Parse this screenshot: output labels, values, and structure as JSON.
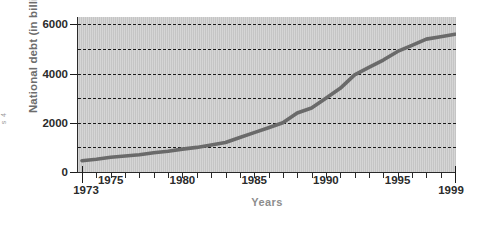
{
  "edge_fragment": {
    "text": "s 4"
  },
  "chart_data": {
    "type": "line",
    "title": "",
    "subtitle": "",
    "xlabel": "Years",
    "ylabel": "National debt (in billions)",
    "xlim": [
      1973,
      1999
    ],
    "ylim": [
      0,
      6300
    ],
    "grid": "horizontal dashed gridlines every 1000",
    "legend": "none",
    "plot_background_color": "#cacaca",
    "line_color": "#6a6a6a",
    "gridline_color": "#1a1a1a",
    "axis_color": "#2a2a2a",
    "tick_label_color": "#2b2b2b",
    "xlabel_color": "#8d8d8d",
    "ylabel_color": "#6d6d6d",
    "y_ticks_labeled": [
      0,
      2000,
      4000,
      6000
    ],
    "y_gridlines": [
      1000,
      2000,
      3000,
      4000,
      5000,
      6000
    ],
    "x_ticks_labeled": [
      1973,
      1975,
      1980,
      1985,
      1990,
      1995,
      1999
    ],
    "x_tick_labels": [
      "1973",
      "1975",
      "1980",
      "1985",
      "1990",
      "1995",
      "1999"
    ],
    "y_tick_labels": [
      "0",
      "2000",
      "4000",
      "6000"
    ],
    "x_minor_ticks": [
      1974,
      1975,
      1976,
      1977,
      1978,
      1979,
      1980,
      1981,
      1982,
      1983,
      1984,
      1985,
      1986,
      1987,
      1988,
      1989,
      1990,
      1991,
      1992,
      1993,
      1994,
      1995,
      1996,
      1997,
      1998
    ],
    "series": [
      {
        "name": "National debt",
        "units": "billions of dollars",
        "x": [
          1973,
          1974,
          1975,
          1976,
          1977,
          1978,
          1979,
          1980,
          1981,
          1982,
          1983,
          1984,
          1985,
          1986,
          1987,
          1988,
          1989,
          1990,
          1991,
          1992,
          1993,
          1994,
          1995,
          1996,
          1997,
          1998,
          1999
        ],
        "values": [
          460,
          520,
          600,
          650,
          700,
          780,
          840,
          930,
          1000,
          1100,
          1200,
          1400,
          1600,
          1800,
          2000,
          2400,
          2600,
          3000,
          3400,
          3950,
          4250,
          4550,
          4900,
          5150,
          5400,
          5500,
          5600
        ]
      }
    ]
  }
}
